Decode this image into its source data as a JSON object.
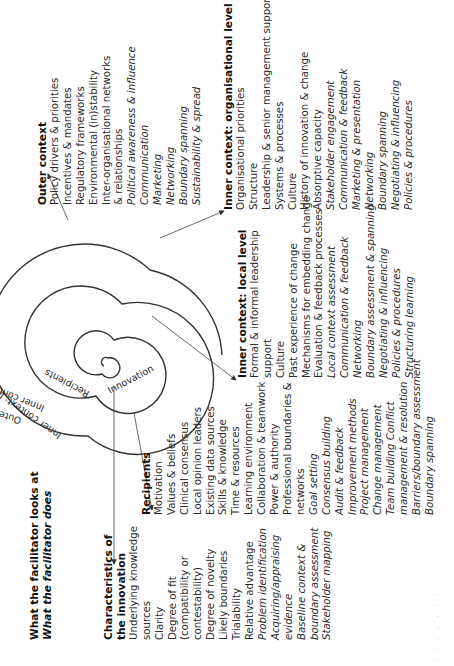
{
  "title": {
    "line1": "What the facilitator looks at",
    "line2": "What the facilitator does"
  },
  "spiral_labels": [
    "Outer context",
    "Inner context:",
    "Inner context: Local",
    "Recipients",
    "Innovation"
  ],
  "outer_context": {
    "heading": "Outer context",
    "items": [
      {
        "text": "Policy drivers & priorities",
        "italic": false
      },
      {
        "text": "Incentives & mandates",
        "italic": false
      },
      {
        "text": "Regulatory frameworks",
        "italic": false
      },
      {
        "text": "Environmental (in)stability",
        "italic": false
      },
      {
        "text": "Inter-organisational networks",
        "italic": false
      },
      {
        "text": "& relationships",
        "italic": false
      },
      {
        "text": "Political awareness & influence",
        "italic": true
      },
      {
        "text": "Communication",
        "italic": true
      },
      {
        "text": "Marketing",
        "italic": true
      },
      {
        "text": "Networking",
        "italic": true
      },
      {
        "text": "Boundary spanning",
        "italic": true
      },
      {
        "text": "Sustainability & spread",
        "italic": true
      }
    ]
  },
  "organisational_level": {
    "heading": "Inner context: organisational level",
    "items": [
      {
        "text": "Organisational priorities",
        "italic": false
      },
      {
        "text": "Structure",
        "italic": false
      },
      {
        "text": "Leadership & senior management support",
        "italic": false
      },
      {
        "text": "Systems & processes",
        "italic": false
      },
      {
        "text": "Culture",
        "italic": false
      },
      {
        "text": "History of innovation & change",
        "italic": false
      },
      {
        "text": "Absorptive capacity",
        "italic": false
      },
      {
        "text": "Stakeholder engagement",
        "italic": true
      },
      {
        "text": "Communication & feedback",
        "italic": true
      },
      {
        "text": "Marketing & presentation",
        "italic": true
      },
      {
        "text": "Networking",
        "italic": true
      },
      {
        "text": "Boundary spanning",
        "italic": true
      },
      {
        "text": "Negotiating & influencing",
        "italic": true
      },
      {
        "text": "Policies & procedures",
        "italic": true
      }
    ]
  },
  "local_level": {
    "heading": "Inner context: local level",
    "items": [
      {
        "text": "Formal & informal leadership",
        "italic": false
      },
      {
        "text": "support",
        "italic": false
      },
      {
        "text": "Culture",
        "italic": false
      },
      {
        "text": "Past experience of change",
        "italic": false
      },
      {
        "text": "Mechanisms for embedding change",
        "italic": false
      },
      {
        "text": "Evaluation & feedback processes",
        "italic": false
      },
      {
        "text": "Local context assessment",
        "italic": true
      },
      {
        "text": "Communication & feedback",
        "italic": true
      },
      {
        "text": "Networking",
        "italic": true
      },
      {
        "text": "Boundary  assessment & spanning",
        "italic": true
      },
      {
        "text": "Negotiating & influencing",
        "italic": true
      },
      {
        "text": "Policies &  procedures",
        "italic": true
      },
      {
        "text": "Structuring learning",
        "italic": true
      }
    ]
  },
  "recipients": {
    "heading": "Recipients",
    "items": [
      {
        "text": "Motivation",
        "italic": false
      },
      {
        "text": "Values & beliefs",
        "italic": false
      },
      {
        "text": "Clinical  consensus",
        "italic": false
      },
      {
        "text": "Local opinion leaders",
        "italic": false
      },
      {
        "text": "Existing data sources",
        "italic": false
      },
      {
        "text": "Skills & knowledge",
        "italic": false
      },
      {
        "text": "Time & resources",
        "italic": false
      },
      {
        "text": "Learning environment",
        "italic": false
      },
      {
        "text": "Collaboration & teamwork",
        "italic": false
      },
      {
        "text": "Power & authority",
        "italic": false
      },
      {
        "text": "Professional boundaries &",
        "italic": false
      },
      {
        "text": "networks",
        "italic": false
      },
      {
        "text": "Goal setting",
        "italic": true
      },
      {
        "text": "Consensus building",
        "italic": true
      },
      {
        "text": "Audit & feedback",
        "italic": true
      },
      {
        "text": "Improvement methods",
        "italic": true
      },
      {
        "text": "Project management",
        "italic": true
      },
      {
        "text": "Change management",
        "italic": true
      },
      {
        "text": "Team building Conflict",
        "italic": true
      },
      {
        "text": "management & resolution",
        "italic": true
      },
      {
        "text": "Barriers/boundary assessment",
        "italic": true
      },
      {
        "text": "Boundary spanning",
        "italic": true
      }
    ]
  },
  "innovation": {
    "heading_line1": "Characteristics of",
    "heading_line2": "the innovation",
    "items": [
      {
        "text": "Underlying knowledge",
        "italic": false
      },
      {
        "text": "sources",
        "italic": false
      },
      {
        "text": "Clarity",
        "italic": false
      },
      {
        "text": "Degree of fit",
        "italic": false
      },
      {
        "text": "(compatibility or",
        "italic": false
      },
      {
        "text": "contestability)",
        "italic": false
      },
      {
        "text": "Degree of novelty",
        "italic": false
      },
      {
        "text": "Likely boundaries",
        "italic": false
      },
      {
        "text": "Trialability",
        "italic": false
      },
      {
        "text": "Relative advantage",
        "italic": false
      },
      {
        "text": "Problem identification",
        "italic": true
      },
      {
        "text": "Acquiring/appraising",
        "italic": true
      },
      {
        "text": "evidence",
        "italic": true
      },
      {
        "text": "Baseline context &",
        "italic": true
      },
      {
        "text": "boundary assessment",
        "italic": true
      },
      {
        "text": "Stakeholder mapping",
        "italic": true
      }
    ]
  },
  "colors": {
    "text": "#2a2a2a",
    "lines": "#333333",
    "background": "#ffffff"
  }
}
